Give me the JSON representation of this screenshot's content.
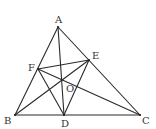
{
  "diagram": {
    "type": "geometry",
    "points": {
      "A": {
        "x": 58,
        "y": 27,
        "label": "A",
        "lx": 55,
        "ly": 23
      },
      "B": {
        "x": 15,
        "y": 115,
        "label": "B",
        "lx": 4,
        "ly": 124
      },
      "C": {
        "x": 140,
        "y": 115,
        "label": "C",
        "lx": 142,
        "ly": 124
      },
      "D": {
        "x": 64,
        "y": 115,
        "label": "D",
        "lx": 61,
        "ly": 127
      },
      "E": {
        "x": 89,
        "y": 60,
        "label": "E",
        "lx": 92,
        "ly": 59
      },
      "F": {
        "x": 38,
        "y": 69,
        "label": "F",
        "lx": 28,
        "ly": 71
      },
      "O": {
        "x": 62,
        "y": 80,
        "label": "O",
        "lx": 66,
        "ly": 92
      }
    },
    "segments": [
      [
        "A",
        "B"
      ],
      [
        "A",
        "C"
      ],
      [
        "B",
        "C"
      ],
      [
        "A",
        "D"
      ],
      [
        "B",
        "E"
      ],
      [
        "C",
        "F"
      ],
      [
        "F",
        "E"
      ],
      [
        "F",
        "D"
      ],
      [
        "E",
        "D"
      ]
    ],
    "stroke_color": "#2a2a2a",
    "label_color": "#333333"
  }
}
